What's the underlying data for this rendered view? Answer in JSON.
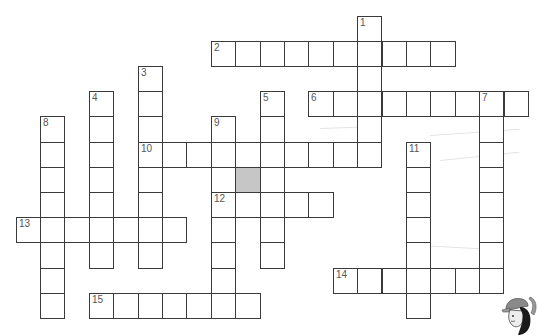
{
  "puzzle": {
    "type": "crossword",
    "grid": {
      "origin_x": 15.5,
      "origin_y": 15.5,
      "cell_w": 24.4,
      "cell_h": 25.2
    },
    "words": [
      {
        "number": "1",
        "dir": "down",
        "row": 0,
        "col": 14,
        "length": 6
      },
      {
        "number": "2",
        "dir": "across",
        "row": 1,
        "col": 8,
        "length": 10
      },
      {
        "number": "3",
        "dir": "down",
        "row": 2,
        "col": 5,
        "length": 8
      },
      {
        "number": "4",
        "dir": "down",
        "row": 3,
        "col": 3,
        "length": 7
      },
      {
        "number": "5",
        "dir": "down",
        "row": 3,
        "col": 10,
        "length": 7
      },
      {
        "number": "6",
        "dir": "across",
        "row": 3,
        "col": 12,
        "length": 9
      },
      {
        "number": "7",
        "dir": "down",
        "row": 3,
        "col": 19,
        "length": 8
      },
      {
        "number": "8",
        "dir": "down",
        "row": 4,
        "col": 1,
        "length": 8
      },
      {
        "number": "9",
        "dir": "down",
        "row": 4,
        "col": 8,
        "length": 8
      },
      {
        "number": "10",
        "dir": "across",
        "row": 5,
        "col": 5,
        "length": 10
      },
      {
        "number": "11",
        "dir": "down",
        "row": 5,
        "col": 16,
        "length": 7
      },
      {
        "number": "12",
        "dir": "across",
        "row": 7,
        "col": 8,
        "length": 5
      },
      {
        "number": "13",
        "dir": "across",
        "row": 8,
        "col": 0,
        "length": 7
      },
      {
        "number": "14",
        "dir": "across",
        "row": 10,
        "col": 13,
        "length": 7
      },
      {
        "number": "15",
        "dir": "across",
        "row": 11,
        "col": 3,
        "length": 7
      }
    ],
    "shaded_cells": [
      {
        "row": 6,
        "col": 9
      }
    ],
    "colors": {
      "border": "#3a3a3a",
      "shaded": "#c6c6c6",
      "number": "#555555"
    }
  },
  "decorations": {
    "mascot": "cartoon-character-icon"
  }
}
